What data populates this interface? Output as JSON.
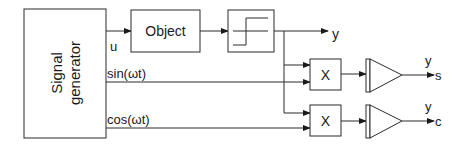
{
  "diagram": {
    "blocks": {
      "signal_generator": {
        "line1": "Signal",
        "line2": "generator"
      },
      "object": {
        "label": "Object"
      },
      "relay": {
        "label": ""
      },
      "multiplier_sin": {
        "label": "X"
      },
      "multiplier_cos": {
        "label": "X"
      },
      "integrator_sin": {
        "label": ""
      },
      "integrator_cos": {
        "label": ""
      }
    },
    "signals": {
      "u": "u",
      "sin": "sin(ωt)",
      "cos": "cos(ωt)",
      "y_out": "y",
      "y_s": "y",
      "s": "s",
      "y_c": "y",
      "c": "c"
    }
  }
}
